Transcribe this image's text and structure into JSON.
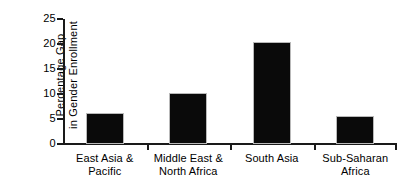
{
  "chart_data": {
    "type": "bar",
    "title": "",
    "subtitle": "",
    "xlabel": "",
    "ylabel": "Percentage Gap in Gender Enrollment",
    "ylabel_lines": [
      "Percentage Gap",
      "in Gender Enrollment"
    ],
    "categories": [
      "East Asia & Pacific",
      "Middle East & North Africa",
      "South Asia",
      "Sub-Saharan Africa"
    ],
    "category_lines": [
      [
        "East Asia &",
        "Pacific"
      ],
      [
        "Middle East &",
        "North Africa"
      ],
      [
        "South Asia",
        ""
      ],
      [
        "Sub-Saharan",
        "Africa"
      ]
    ],
    "values": [
      6.2,
      10.3,
      20.5,
      5.6
    ],
    "ylim": [
      0,
      25
    ],
    "yticks": [
      0,
      5,
      10,
      15,
      20,
      25
    ],
    "ytick_labels": [
      "0",
      "5",
      "10",
      "15",
      "20",
      "25"
    ],
    "grid": false,
    "legend": false,
    "legend_position": "none",
    "bar_color": "#0a0a0a",
    "bar_edge_color": "#b9b9b9",
    "axis_color": "#1a1a1a",
    "background_color": "#ffffff"
  }
}
